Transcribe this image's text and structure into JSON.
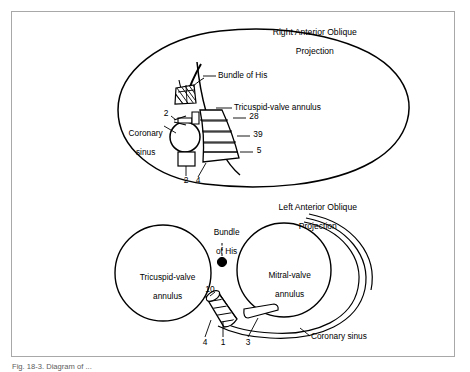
{
  "figure": {
    "caption": "Fig. 18-3. Diagram of ...",
    "border_color": "#a8a8a8",
    "ink_color": "#000000",
    "background": "#ffffff"
  },
  "panels": {
    "top": {
      "title_line1": "Right Anterior Oblique",
      "title_line2": "Projection",
      "labels": {
        "bundle_of_his": "Bundle of His",
        "tricuspid_valve_annulus": "Tricuspid-valve annulus",
        "coronary_sinus_line1": "Coronary",
        "coronary_sinus_line2": "sinus"
      },
      "values": {
        "upper_left": "2",
        "band_top": "28",
        "band_middle": "39",
        "band_bottom": "5",
        "lower_left": "2",
        "lower_right": "4"
      }
    },
    "bottom": {
      "title_line1": "Left Anterior Oblique",
      "title_line2": "Projection",
      "labels": {
        "bundle_of_his_line1": "Bundle",
        "bundle_of_his_line2": "of His",
        "tricuspid_line1": "Tricuspid-valve",
        "tricuspid_line2": "annulus",
        "mitral_line1": "Mitral-valve",
        "mitral_line2": "annulus",
        "coronary_sinus": "Coronary sinus"
      },
      "values": {
        "top_segment": "10",
        "seg_a": "4",
        "seg_b": "1",
        "seg_c": "3"
      }
    }
  }
}
